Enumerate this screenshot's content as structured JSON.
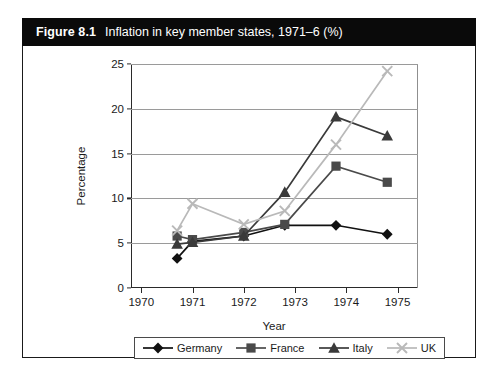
{
  "figure": {
    "number": "Figure 8.1",
    "title": "Inflation in key member states, 1971–6 (%)"
  },
  "chart_data": {
    "type": "line",
    "title": "Inflation in key member states, 1971–6 (%)",
    "xlabel": "Year",
    "ylabel": "Percentage",
    "x": [
      1970.7,
      1971.0,
      1972.0,
      1972.8,
      1973.8,
      1974.8
    ],
    "categories": [
      "1970",
      "1971",
      "1972",
      "1973",
      "1974",
      "1975"
    ],
    "xlim": [
      1969.8,
      1975.4
    ],
    "ylim": [
      0,
      25
    ],
    "yticks": [
      0,
      5,
      10,
      15,
      20,
      25
    ],
    "grid": true,
    "legend_position": "bottom",
    "series": [
      {
        "name": "Germany",
        "marker": "diamond",
        "color": "#111111",
        "values": [
          3.3,
          5.2,
          5.8,
          7.0,
          7.0,
          6.0
        ]
      },
      {
        "name": "France",
        "marker": "square",
        "color": "#4a4a4a",
        "values": [
          5.8,
          5.4,
          6.2,
          7.1,
          13.6,
          11.8
        ]
      },
      {
        "name": "Italy",
        "marker": "triangle",
        "color": "#3a3a3a",
        "values": [
          4.9,
          5.1,
          5.8,
          10.7,
          19.1,
          17.0
        ]
      },
      {
        "name": "UK",
        "marker": "cross",
        "color": "#b9b9b9",
        "values": [
          6.4,
          9.4,
          7.1,
          8.6,
          16.0,
          24.2
        ]
      }
    ]
  },
  "colors": {
    "header_bg": "#0a0a0a",
    "header_text": "#ffffff",
    "grid": "#9a9a9a",
    "axis": "#2a2a2a",
    "germany": "#111111",
    "france": "#4a4a4a",
    "italy": "#3a3a3a",
    "uk": "#b9b9b9"
  }
}
